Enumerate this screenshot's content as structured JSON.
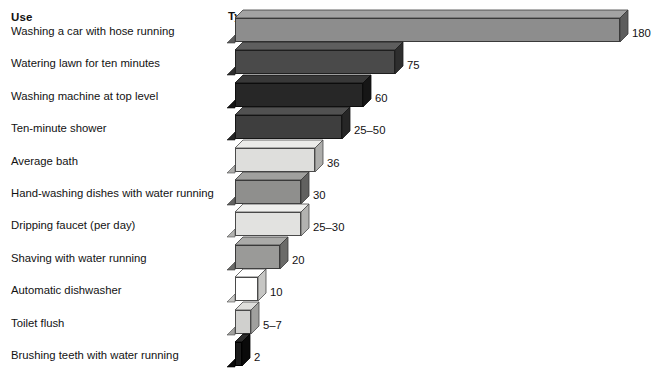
{
  "headers": {
    "use": "Use",
    "value": "Typical Gallons of Water Used"
  },
  "chart_data": {
    "type": "bar",
    "orientation": "horizontal",
    "title": "Typical Gallons of Water Used",
    "xlabel": "Typical Gallons of Water Used",
    "ylabel": "Use",
    "grid": false,
    "legend": "none",
    "xlim": [
      0,
      180
    ],
    "categories": [
      "Washing a car with hose running",
      "Watering lawn for ten minutes",
      "Washing machine at top level",
      "Ten-minute shower",
      "Average bath",
      "Hand-washing dishes with water running",
      "Dripping faucet (per day)",
      "Shaving with water running",
      "Automatic dishwasher",
      "Toilet flush",
      "Brushing teeth with water running"
    ],
    "values": [
      180,
      75,
      60,
      50,
      36,
      30,
      30,
      20,
      10,
      7,
      2
    ],
    "value_labels": [
      "180",
      "75",
      "60",
      "25–50",
      "36",
      "30",
      "25–30",
      "20",
      "10",
      "5–7",
      "2"
    ]
  },
  "bars": [
    {
      "label": "Washing a car with hose running",
      "value_label": "180",
      "value": 180,
      "length": 385,
      "front": "#8d8d8d",
      "top": "#a3a3a3",
      "side": "#5d5d5d",
      "edge": "#3a3a3a"
    },
    {
      "label": "Watering lawn for ten minutes",
      "value_label": "75",
      "value": 75,
      "length": 160,
      "front": "#4a4a4a",
      "top": "#5e5e5e",
      "side": "#2e2e2e",
      "edge": "#1f1f1f"
    },
    {
      "label": "Washing machine at top level",
      "value_label": "60",
      "value": 60,
      "length": 128,
      "front": "#272727",
      "top": "#383838",
      "side": "#161616",
      "edge": "#0d0d0d"
    },
    {
      "label": "Ten-minute shower",
      "value_label": "25–50",
      "value": 50,
      "length": 107,
      "front": "#3e3e3e",
      "top": "#515151",
      "side": "#262626",
      "edge": "#151515"
    },
    {
      "label": "Average bath",
      "value_label": "36",
      "value": 36,
      "length": 80,
      "front": "#dededc",
      "top": "#ebebe9",
      "side": "#adadab",
      "edge": "#4a4a4a"
    },
    {
      "label": "Hand-washing dishes with water running",
      "value_label": "30",
      "value": 30,
      "length": 66,
      "front": "#8f8f8d",
      "top": "#a0a09e",
      "side": "#616160",
      "edge": "#3a3a3a"
    },
    {
      "label": "Dripping faucet (per day)",
      "value_label": "25–30",
      "value": 30,
      "length": 66,
      "front": "#e2e2e0",
      "top": "#efefed",
      "side": "#b2b2b0",
      "edge": "#4a4a4a"
    },
    {
      "label": "Shaving with water running",
      "value_label": "20",
      "value": 20,
      "length": 45,
      "front": "#9a9a98",
      "top": "#aaaaa8",
      "side": "#6b6b69",
      "edge": "#3a3a3a"
    },
    {
      "label": "Automatic dishwasher",
      "value_label": "10",
      "value": 10,
      "length": 23,
      "front": "#ffffff",
      "top": "#ffffff",
      "side": "#c6c6c4",
      "edge": "#4a4a4a"
    },
    {
      "label": "Toilet flush",
      "value_label": "5–7",
      "value": 7,
      "length": 16,
      "front": "#d0d0ce",
      "top": "#dededc",
      "side": "#a0a09e",
      "edge": "#4a4a4a"
    },
    {
      "label": "Brushing teeth with water running",
      "value_label": "2",
      "value": 2,
      "length": 7,
      "front": "#1b1b1b",
      "top": "#2c2c2c",
      "side": "#0a0a0a",
      "edge": "#000000"
    }
  ]
}
